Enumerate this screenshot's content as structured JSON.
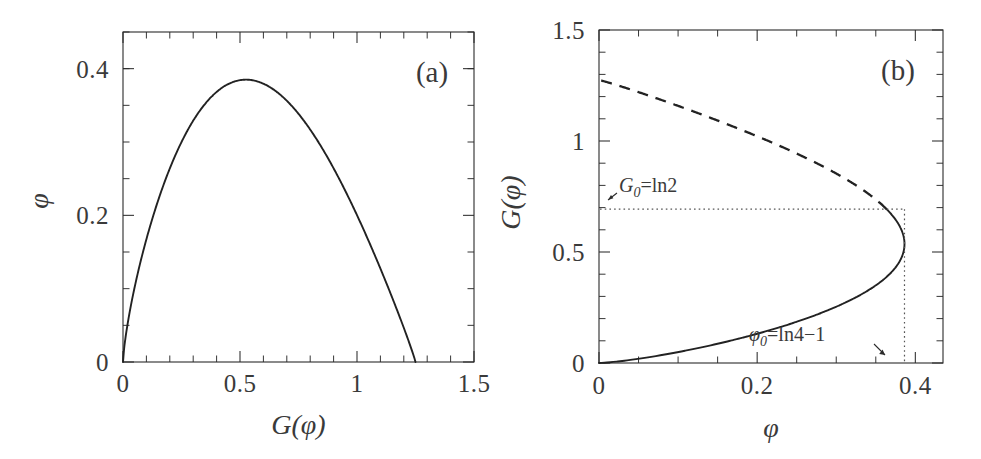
{
  "figure": {
    "background": "#ffffff",
    "ink": "#2b2b2b",
    "panels": [
      {
        "id": "a",
        "label": "(a)",
        "xlabel": "G(φ)",
        "ylabel": "φ",
        "xticklabels": [
          "0",
          "0.5",
          "1",
          "1.5"
        ],
        "yticklabels": [
          "0",
          "0.2",
          "0.4"
        ]
      },
      {
        "id": "b",
        "label": "(b)",
        "xlabel": "φ",
        "ylabel": "G(φ)",
        "xticklabels": [
          "0",
          "0.2",
          "0.4"
        ],
        "yticklabels": [
          "0",
          "0.5",
          "1",
          "1.5"
        ],
        "annotations": [
          {
            "id": "G0",
            "text_main": "G",
            "text_sub": "0",
            "text_rest": "=ln2"
          },
          {
            "id": "phi0",
            "text_main": "φ",
            "text_sub": "0",
            "text_rest": "=ln4−1"
          }
        ]
      }
    ]
  },
  "chart_data": [
    {
      "type": "line",
      "panel": "a",
      "title": "(a)",
      "xlabel": "G(φ)",
      "ylabel": "φ",
      "xlim": [
        0,
        1.5
      ],
      "ylim": [
        0,
        0.45
      ],
      "xticks": [
        0,
        0.5,
        1,
        1.5
      ],
      "yticks": [
        0,
        0.2,
        0.4
      ],
      "xminor_step": 0.1,
      "yminor_step": 0.05,
      "grid": false,
      "legend": "none",
      "series": [
        {
          "name": "φ vs G(φ)",
          "style": "solid",
          "x": [
            0.0,
            0.05,
            0.1,
            0.15,
            0.2,
            0.25,
            0.3,
            0.35,
            0.4,
            0.45,
            0.5,
            0.55,
            0.6,
            0.65,
            0.6931,
            0.75,
            0.8,
            0.85,
            0.9,
            0.95,
            1.0,
            1.05,
            1.1,
            1.15,
            1.2,
            1.23,
            1.25
          ],
          "y": [
            0.0,
            0.0405,
            0.0755,
            0.1065,
            0.1345,
            0.16,
            0.1833,
            0.2046,
            0.2242,
            0.2421,
            0.2585,
            0.2733,
            0.2866,
            0.2985,
            0.3045,
            0.318,
            0.3255,
            0.3315,
            0.336,
            0.3387,
            0.3394,
            0.3375,
            0.332,
            0.321,
            0.299,
            0.272,
            0.23
          ]
        }
      ],
      "notes": {
        "peak_y": 0.385,
        "peak_x": 0.69,
        "zero_crossings_x": [
          0.0,
          1.25
        ]
      }
    },
    {
      "type": "line",
      "panel": "b",
      "title": "(b)",
      "xlabel": "φ",
      "ylabel": "G(φ)",
      "xlim": [
        0,
        0.435
      ],
      "ylim": [
        0,
        1.5
      ],
      "xticks": [
        0,
        0.2,
        0.4
      ],
      "yticks": [
        0,
        0.5,
        1,
        1.5
      ],
      "xminor_step": 0.05,
      "yminor_step": 0.1,
      "grid": false,
      "legend": "none",
      "series": [
        {
          "name": "lower branch (stable)",
          "style": "solid",
          "x": [
            0.0,
            0.02,
            0.05,
            0.08,
            0.12,
            0.16,
            0.2,
            0.24,
            0.28,
            0.31,
            0.335,
            0.355,
            0.37,
            0.379,
            0.3846,
            0.3863
          ],
          "y": [
            0.0,
            0.035,
            0.085,
            0.137,
            0.205,
            0.275,
            0.345,
            0.415,
            0.48,
            0.53,
            0.572,
            0.61,
            0.642,
            0.665,
            0.686,
            0.693
          ]
        },
        {
          "name": "upper branch (unstable)",
          "style": "dashed",
          "x": [
            0.3863,
            0.3846,
            0.38,
            0.37,
            0.355,
            0.335,
            0.305,
            0.27,
            0.23,
            0.19,
            0.15,
            0.11,
            0.07,
            0.035,
            0.0
          ],
          "y": [
            0.693,
            0.703,
            0.723,
            0.757,
            0.8,
            0.85,
            0.915,
            0.98,
            1.048,
            1.108,
            1.158,
            1.2,
            1.235,
            1.258,
            1.275
          ]
        }
      ],
      "markers": {
        "turning_point": {
          "x": 0.3863,
          "y": 0.6931
        },
        "G0": 0.6931,
        "phi0": 0.3863
      },
      "guides": [
        {
          "id": "G0-horizontal",
          "style": "dotted",
          "from": [
            0,
            0.6931
          ],
          "to": [
            0.3863,
            0.6931
          ]
        },
        {
          "id": "phi0-vertical",
          "style": "dotted",
          "from": [
            0.3863,
            0.6931
          ],
          "to": [
            0.3863,
            0.0
          ]
        }
      ]
    }
  ]
}
